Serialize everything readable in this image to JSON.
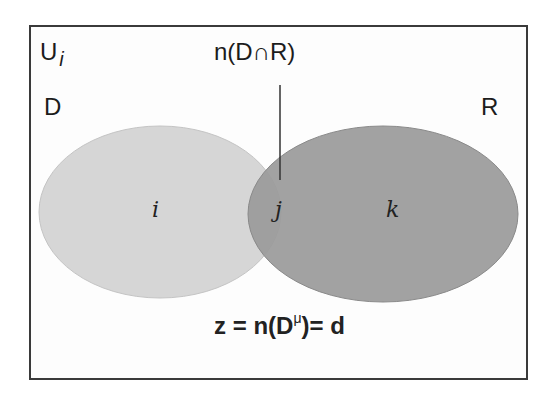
{
  "diagram": {
    "type": "venn",
    "universe": {
      "label": "U",
      "subscript": "i"
    },
    "sets": [
      {
        "name": "D",
        "label": "D",
        "fill": "#d4d4d4"
      },
      {
        "name": "R",
        "label": "R",
        "fill": "#9a9a9a"
      }
    ],
    "intersection_label": "n(D∩R)",
    "regions": {
      "i": "i",
      "j": "j",
      "k": "k"
    },
    "formula": {
      "prefix": "z = n(D",
      "superscript": "μ",
      "suffix": ")= d"
    },
    "colors": {
      "border": "#3a3a3a",
      "set_d": "#d4d4d4",
      "set_r": "#9a9a9a",
      "text": "#1c1c1c"
    }
  }
}
